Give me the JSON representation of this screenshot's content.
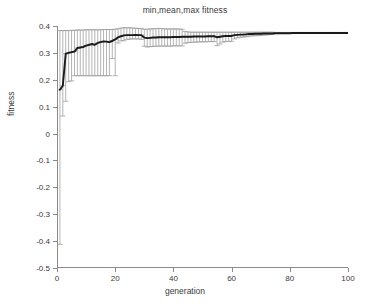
{
  "chart_data": {
    "type": "line",
    "title": "min,mean,max fitness",
    "xlabel": "generation",
    "ylabel": "fitness",
    "xlim": [
      0,
      100
    ],
    "ylim": [
      -0.5,
      0.4
    ],
    "xticks": [
      0,
      20,
      40,
      60,
      80,
      100
    ],
    "xtick_labels": [
      "0",
      "20",
      "40",
      "60",
      "80",
      "100"
    ],
    "yticks": [
      -0.5,
      -0.4,
      -0.3,
      -0.2,
      -0.1,
      0,
      0.1,
      0.2,
      0.3,
      0.4
    ],
    "ytick_labels": [
      "-0.5",
      "-0.4",
      "-0.3",
      "-0.2",
      "-0.1",
      "0",
      "0.1",
      "0.2",
      "0.3",
      "0.4"
    ],
    "grid": false,
    "legend": null,
    "colors": {
      "mean_line": "#1a1a1a",
      "errorbar": "#9a9a9a",
      "axis": "#8a8a8a",
      "background": "#ffffff"
    },
    "x": [
      1,
      2,
      3,
      4,
      5,
      6,
      7,
      8,
      9,
      10,
      11,
      12,
      13,
      14,
      15,
      16,
      17,
      18,
      19,
      20,
      21,
      22,
      23,
      24,
      25,
      26,
      27,
      28,
      29,
      30,
      31,
      32,
      33,
      34,
      35,
      36,
      37,
      38,
      39,
      40,
      41,
      42,
      43,
      44,
      45,
      46,
      47,
      48,
      49,
      50,
      51,
      52,
      53,
      54,
      55,
      56,
      57,
      58,
      59,
      60,
      61,
      62,
      63,
      64,
      65,
      66,
      67,
      68,
      69,
      70,
      71,
      72,
      73,
      74,
      75,
      76,
      77,
      78,
      79,
      80,
      81,
      82,
      83,
      84,
      85,
      86,
      87,
      88,
      89,
      90,
      91,
      92,
      93,
      94,
      95,
      96,
      97,
      98,
      99,
      100
    ],
    "series": [
      {
        "name": "mean",
        "values": [
          0.163,
          0.178,
          0.297,
          0.3,
          0.303,
          0.305,
          0.318,
          0.32,
          0.322,
          0.327,
          0.33,
          0.333,
          0.33,
          0.337,
          0.34,
          0.343,
          0.342,
          0.34,
          0.345,
          0.35,
          0.358,
          0.362,
          0.365,
          0.366,
          0.366,
          0.366,
          0.367,
          0.366,
          0.366,
          0.357,
          0.355,
          0.356,
          0.357,
          0.357,
          0.358,
          0.358,
          0.358,
          0.358,
          0.358,
          0.359,
          0.359,
          0.359,
          0.36,
          0.36,
          0.36,
          0.36,
          0.361,
          0.361,
          0.361,
          0.361,
          0.361,
          0.362,
          0.362,
          0.362,
          0.358,
          0.36,
          0.362,
          0.363,
          0.363,
          0.363,
          0.366,
          0.367,
          0.368,
          0.368,
          0.369,
          0.37,
          0.37,
          0.371,
          0.371,
          0.371,
          0.372,
          0.372,
          0.372,
          0.372,
          0.373,
          0.373,
          0.373,
          0.373,
          0.373,
          0.373,
          0.374,
          0.374,
          0.374,
          0.374,
          0.374,
          0.374,
          0.374,
          0.374,
          0.374,
          0.374,
          0.374,
          0.374,
          0.374,
          0.374,
          0.374,
          0.374,
          0.374,
          0.374,
          0.374,
          0.374
        ]
      },
      {
        "name": "max",
        "values": [
          0.383,
          0.383,
          0.383,
          0.383,
          0.384,
          0.384,
          0.385,
          0.385,
          0.385,
          0.386,
          0.386,
          0.386,
          0.386,
          0.386,
          0.386,
          0.387,
          0.387,
          0.387,
          0.387,
          0.388,
          0.39,
          0.392,
          0.394,
          0.393,
          0.394,
          0.392,
          0.392,
          0.391,
          0.39,
          0.388,
          0.388,
          0.389,
          0.39,
          0.39,
          0.391,
          0.39,
          0.39,
          0.389,
          0.389,
          0.389,
          0.389,
          0.389,
          0.388,
          0.38,
          0.378,
          0.377,
          0.377,
          0.377,
          0.377,
          0.377,
          0.377,
          0.377,
          0.377,
          0.377,
          0.377,
          0.377,
          0.377,
          0.377,
          0.377,
          0.377,
          0.377,
          0.377,
          0.377,
          0.377,
          0.377,
          0.377,
          0.377,
          0.377,
          0.377,
          0.377,
          0.377,
          0.377,
          0.377,
          0.377,
          0.376,
          0.376,
          0.376,
          0.376,
          0.376,
          0.376,
          0.376,
          0.376,
          0.376,
          0.376,
          0.376,
          0.376,
          0.376,
          0.376,
          0.376,
          0.376,
          0.376,
          0.376,
          0.376,
          0.376,
          0.376,
          0.376,
          0.376,
          0.376,
          0.376,
          0.376
        ]
      },
      {
        "name": "min",
        "values": [
          -0.412,
          0.065,
          0.12,
          0.193,
          0.196,
          0.215,
          0.215,
          0.215,
          0.215,
          0.215,
          0.215,
          0.215,
          0.215,
          0.215,
          0.215,
          0.215,
          0.215,
          0.215,
          0.279,
          0.215,
          0.337,
          0.345,
          0.345,
          0.35,
          0.351,
          0.352,
          0.352,
          0.352,
          0.35,
          0.325,
          0.322,
          0.323,
          0.324,
          0.325,
          0.325,
          0.325,
          0.325,
          0.325,
          0.325,
          0.326,
          0.326,
          0.326,
          0.326,
          0.336,
          0.338,
          0.339,
          0.34,
          0.34,
          0.341,
          0.341,
          0.341,
          0.342,
          0.342,
          0.342,
          0.327,
          0.333,
          0.34,
          0.342,
          0.343,
          0.343,
          0.352,
          0.356,
          0.358,
          0.359,
          0.36,
          0.362,
          0.363,
          0.364,
          0.364,
          0.365,
          0.366,
          0.367,
          0.368,
          0.369,
          0.372,
          0.372,
          0.373,
          0.373,
          0.373,
          0.373,
          0.374,
          0.374,
          0.374,
          0.374,
          0.374,
          0.374,
          0.374,
          0.374,
          0.374,
          0.374,
          0.374,
          0.374,
          0.374,
          0.374,
          0.374,
          0.374,
          0.374,
          0.374,
          0.374,
          0.374
        ]
      }
    ]
  }
}
